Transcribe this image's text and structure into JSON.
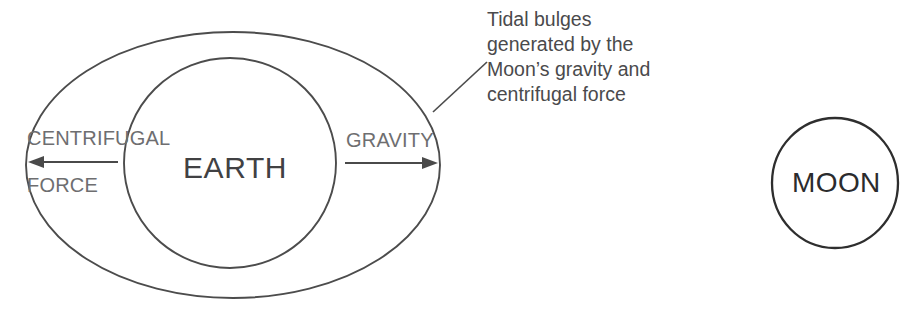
{
  "diagram": {
    "bodies": {
      "earth_label": "EARTH",
      "moon_label": "MOON",
      "bulge_shape_name": "tidal-bulge-ellipse"
    },
    "force_labels": {
      "left_line1": "CENTRIFUGAL",
      "left_line2": "FORCE",
      "right_line1": "GRAVITY"
    },
    "annotation": {
      "line1": "Tidal bulges",
      "line2": "generated by the",
      "line3": "Moon’s gravity and",
      "line4": "centrifugal force"
    },
    "arrows": {
      "left_direction": "left",
      "right_direction": "right"
    },
    "colors": {
      "outline": "#4c4c4c",
      "moon_outline": "#2e2e2e",
      "label_gray": "#6e6e70",
      "earth_text": "#414143",
      "moon_text": "#2b2b2d",
      "annotation_text": "#4a4a4c",
      "background": "#ffffff"
    }
  }
}
